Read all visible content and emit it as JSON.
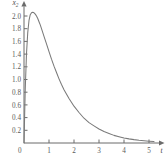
{
  "chart_data": {
    "type": "line",
    "title": "",
    "xlabel": "t",
    "ylabel": "x2",
    "ylabel_base": "x",
    "ylabel_sub": "2",
    "xlim": [
      0,
      5.4
    ],
    "ylim": [
      0,
      2.15
    ],
    "grid": false,
    "legend": null,
    "xticks": [
      1,
      2,
      3,
      4,
      5
    ],
    "xticklabels": [
      "1",
      "2",
      "3",
      "4",
      "5"
    ],
    "yticks": [
      0.2,
      0.4,
      0.6,
      0.8,
      1.0,
      1.2,
      1.4,
      1.6,
      1.8,
      2.0
    ],
    "yticklabels": [
      "0.2",
      "0.4",
      "0.6",
      "0.8",
      "1.0",
      "1.2",
      "1.4",
      "1.6",
      "1.8",
      "2.0"
    ],
    "origin_label": "0",
    "curve_color": "#7a7a7a",
    "axis_color": "#6b6b6b",
    "series": [
      {
        "name": "x2(t)",
        "x": [
          0.0,
          0.05,
          0.1,
          0.15,
          0.2,
          0.25,
          0.3,
          0.35,
          0.4,
          0.45,
          0.5,
          0.55,
          0.6,
          0.65,
          0.7,
          0.8,
          0.9,
          1.0,
          1.1,
          1.2,
          1.3,
          1.4,
          1.5,
          1.6,
          1.8,
          2.0,
          2.2,
          2.4,
          2.6,
          2.8,
          3.0,
          3.2,
          3.4,
          3.6,
          3.8,
          4.0,
          4.2,
          4.4,
          4.6,
          4.8,
          5.0,
          5.2
        ],
        "y": [
          0.0,
          0.85,
          1.41,
          1.74,
          1.93,
          2.02,
          2.05,
          2.06,
          2.05,
          2.03,
          2.0,
          1.96,
          1.91,
          1.86,
          1.8,
          1.68,
          1.56,
          1.44,
          1.32,
          1.21,
          1.11,
          1.01,
          0.92,
          0.84,
          0.7,
          0.58,
          0.48,
          0.39,
          0.32,
          0.27,
          0.22,
          0.18,
          0.15,
          0.12,
          0.1,
          0.08,
          0.065,
          0.053,
          0.043,
          0.035,
          0.028,
          0.022
        ],
        "peak_x": 0.35,
        "peak_y": 2.06
      }
    ]
  },
  "geometry": {
    "origin_px_x": 24,
    "origin_px_y": 143,
    "x_unit_px": 25.0,
    "y_unit_px": 63.5
  }
}
